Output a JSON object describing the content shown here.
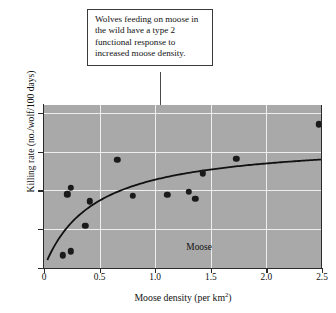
{
  "callout": {
    "text": "Wolves feeding on moose in the wild have a type 2 functional response to increased moose density."
  },
  "chart_data": {
    "type": "scatter",
    "title": "",
    "xlabel": "Moose density (per km",
    "xlabel_sup": "2",
    "xlabel_suffix": ")",
    "ylabel": "Killing rate (no./wolf/100 days)",
    "xlim": [
      0,
      2.5
    ],
    "ylim": [
      0,
      4.2
    ],
    "xticks": [
      "0",
      "0.5",
      "1.0",
      "1.5",
      "2.0",
      "2.5"
    ],
    "xtick_values": [
      0,
      0.5,
      1.0,
      1.5,
      2.0,
      2.5
    ],
    "yticks": [
      "0",
      "1",
      "2",
      "3",
      "4"
    ],
    "ytick_values": [
      0,
      1,
      2,
      3,
      4
    ],
    "grid": true,
    "grid_color": "#eeeeee",
    "plot_background": "#a9a9a9",
    "point_color": "#1a1a1a",
    "curve_color": "#111111",
    "legend_position": "none",
    "annotations": [
      {
        "text": "Moose",
        "x": 1.28,
        "y": 0.52
      }
    ],
    "points": [
      {
        "x": 0.17,
        "y": 0.33
      },
      {
        "x": 0.24,
        "y": 0.43
      },
      {
        "x": 0.21,
        "y": 1.9
      },
      {
        "x": 0.24,
        "y": 2.07
      },
      {
        "x": 0.37,
        "y": 1.09
      },
      {
        "x": 0.41,
        "y": 1.72
      },
      {
        "x": 0.66,
        "y": 2.79
      },
      {
        "x": 0.8,
        "y": 1.86
      },
      {
        "x": 1.11,
        "y": 1.88
      },
      {
        "x": 1.3,
        "y": 1.96
      },
      {
        "x": 1.36,
        "y": 1.78
      },
      {
        "x": 1.43,
        "y": 2.44
      },
      {
        "x": 1.73,
        "y": 2.81
      },
      {
        "x": 2.47,
        "y": 3.7
      }
    ],
    "curve": {
      "description": "type 2 functional response (Holling disc equation)",
      "a": 3.3,
      "b": 0.45,
      "formula": "y = a*x/(b+x)",
      "x_start": 0.03,
      "x_end": 2.5
    }
  }
}
